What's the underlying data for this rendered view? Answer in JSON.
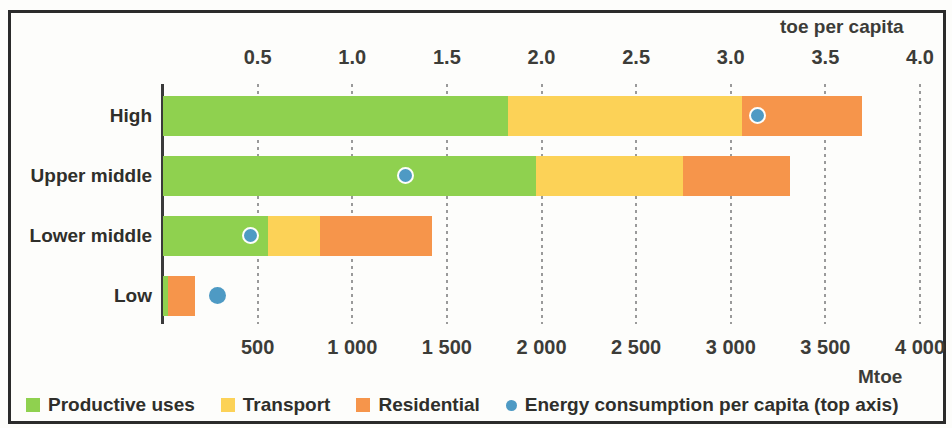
{
  "axes": {
    "top_title": "toe per capita",
    "bottom_title": "Mtoe",
    "top_ticks": [
      "0.5",
      "1.0",
      "1.5",
      "2.0",
      "2.5",
      "3.0",
      "3.5",
      "4.0"
    ],
    "bottom_ticks": [
      "500",
      "1 000",
      "1 500",
      "2 000",
      "2 500",
      "3 000",
      "3 500",
      "4 000"
    ]
  },
  "legend": {
    "items": [
      {
        "label": "Productive uses",
        "marker": "square-swatch",
        "color": "#8fd14f"
      },
      {
        "label": "Transport",
        "marker": "square-swatch",
        "color": "#fcd257"
      },
      {
        "label": "Residential",
        "marker": "square-swatch",
        "color": "#f6954b"
      },
      {
        "label": "Energy consumption per capita (top axis)",
        "marker": "circle-dot",
        "color": "#4e9ac4"
      }
    ]
  },
  "colors": {
    "productive": "#8fd14f",
    "transport": "#fcd257",
    "residential": "#f6954b",
    "dot": "#4e9ac4",
    "text": "#2f2f2b",
    "frame": "#2b2b2b",
    "background": "#fdfdfb"
  },
  "chart_data": {
    "type": "bar",
    "orientation": "horizontal",
    "stacked": true,
    "title": "",
    "subtitle": "",
    "categories": [
      "High",
      "Upper middle",
      "Lower middle",
      "Low"
    ],
    "series": [
      {
        "name": "Productive uses",
        "values": [
          1823,
          1971,
          555,
          26
        ]
      },
      {
        "name": "Transport",
        "values": [
          1237,
          777,
          275,
          0
        ]
      },
      {
        "name": "Residential",
        "values": [
          634,
          565,
          591,
          143
        ]
      }
    ],
    "totals_mtoe": [
      3694,
      3313,
      1421,
      169
    ],
    "overlay": {
      "name": "Energy consumption per capita (top axis)",
      "type": "scatter",
      "marker": "circle",
      "values": [
        3.14,
        1.28,
        0.46,
        0.29
      ],
      "unit": "toe per capita"
    },
    "xlabel_bottom": "Mtoe",
    "xlabel_top": "toe per capita",
    "ylabel": "",
    "xlim_bottom": [
      0,
      4000
    ],
    "xlim_top": [
      0,
      4.0
    ],
    "grid": true,
    "legend_position": "bottom-left"
  }
}
